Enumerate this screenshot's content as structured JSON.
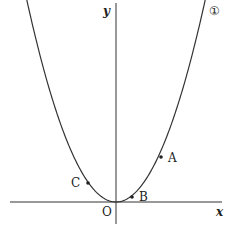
{
  "diagram": {
    "curve_label": "①",
    "axis_x_label": "x",
    "axis_y_label": "y",
    "origin_label": "O",
    "points": [
      {
        "label": "A"
      },
      {
        "label": "B"
      },
      {
        "label": "C"
      }
    ]
  }
}
